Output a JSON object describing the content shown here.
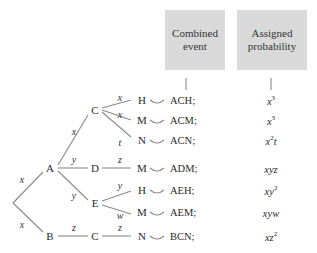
{
  "headers": {
    "combined_event": "Combined event",
    "assigned_probability": "Assigned probability"
  },
  "nodes": {
    "A": "A",
    "B": "B",
    "C1": "C",
    "D": "D",
    "E": "E",
    "C2": "C",
    "H1": "H",
    "M1": "M",
    "N1": "N",
    "M2": "M",
    "H2": "H",
    "M3": "M",
    "N2": "N"
  },
  "edge_labels": {
    "root_A": "x",
    "root_B": "x",
    "A_C": "x",
    "A_D": "y",
    "A_E": "y",
    "C_H": "x",
    "C_M": "x",
    "C_N": "t",
    "D_M": "z",
    "E_H": "y",
    "E_M": "w",
    "B_C": "z",
    "C_N2": "z"
  },
  "rows": [
    {
      "event": "ACH;",
      "prob_base": "x",
      "prob_sup": "3",
      "prob_tail": ""
    },
    {
      "event": "ACM;",
      "prob_base": "x",
      "prob_sup": "3",
      "prob_tail": ""
    },
    {
      "event": "ACN;",
      "prob_base": "x",
      "prob_sup": "2",
      "prob_tail": "t"
    },
    {
      "event": "ADM;",
      "prob_base": "xyz",
      "prob_sup": "",
      "prob_tail": ""
    },
    {
      "event": "AEH;",
      "prob_base": "xy",
      "prob_sup": "2",
      "prob_tail": ""
    },
    {
      "event": "AEM;",
      "prob_base": "xyw",
      "prob_sup": "",
      "prob_tail": ""
    },
    {
      "event": "BCN;",
      "prob_base": "xz",
      "prob_sup": "2",
      "prob_tail": ""
    }
  ],
  "colors": {
    "header_box": "#d9d9d9",
    "lines": "#8a8a8a",
    "text": "#2a2a2a"
  }
}
